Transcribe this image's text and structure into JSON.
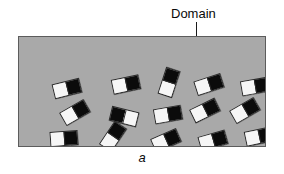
{
  "figure": {
    "caption": "a",
    "annotation_label": "Domain",
    "background_color": "#ffffff",
    "box": {
      "fill_color": "#a9a9a9",
      "border_color": "#5c5c5c",
      "x": 18,
      "y": 36,
      "width": 248,
      "height": 111
    },
    "leader_line": {
      "color": "#1a1a1a",
      "x": 196,
      "y_start": 22,
      "y_end": 51
    },
    "domain_style": {
      "light_color": "#f6f6f6",
      "dark_color": "#0b0b0b",
      "outline_color": "#2b2b2b",
      "width": 28,
      "height": 15
    },
    "domain_count": 20,
    "domains": [
      {
        "id": "domain-1",
        "x": 34,
        "y": 44,
        "rotation": -14,
        "light_side": "left"
      },
      {
        "id": "domain-2",
        "x": 93,
        "y": 40,
        "rotation": -12,
        "light_side": "left"
      },
      {
        "id": "domain-3",
        "x": 136,
        "y": 38,
        "rotation": -72,
        "light_side": "left"
      },
      {
        "id": "domain-4",
        "x": 176,
        "y": 40,
        "rotation": -18,
        "light_side": "left"
      },
      {
        "id": "domain-5",
        "x": 222,
        "y": 42,
        "rotation": -10,
        "light_side": "left"
      },
      {
        "id": "domain-6",
        "x": 42,
        "y": 68,
        "rotation": -30,
        "light_side": "left"
      },
      {
        "id": "domain-7",
        "x": 91,
        "y": 72,
        "rotation": 14,
        "light_side": "right"
      },
      {
        "id": "domain-8",
        "x": 135,
        "y": 70,
        "rotation": -10,
        "light_side": "left"
      },
      {
        "id": "domain-9",
        "x": 172,
        "y": 66,
        "rotation": -26,
        "light_side": "left"
      },
      {
        "id": "domain-10",
        "x": 212,
        "y": 66,
        "rotation": -30,
        "light_side": "left"
      },
      {
        "id": "domain-11",
        "x": 31,
        "y": 94,
        "rotation": -4,
        "light_side": "left"
      },
      {
        "id": "domain-12",
        "x": 80,
        "y": 92,
        "rotation": -56,
        "light_side": "left"
      },
      {
        "id": "domain-13",
        "x": 133,
        "y": 96,
        "rotation": -24,
        "light_side": "left"
      },
      {
        "id": "domain-14",
        "x": 180,
        "y": 96,
        "rotation": -16,
        "light_side": "left"
      },
      {
        "id": "domain-15",
        "x": 226,
        "y": 92,
        "rotation": -12,
        "light_side": "left"
      },
      {
        "id": "domain-16",
        "x": 34,
        "y": 120,
        "rotation": -10,
        "light_side": "left"
      },
      {
        "id": "domain-17",
        "x": 83,
        "y": 122,
        "rotation": -6,
        "light_side": "left"
      },
      {
        "id": "domain-18",
        "x": 128,
        "y": 118,
        "rotation": -32,
        "light_side": "left"
      },
      {
        "id": "domain-19",
        "x": 176,
        "y": 118,
        "rotation": -20,
        "light_side": "left"
      },
      {
        "id": "domain-20",
        "x": 222,
        "y": 120,
        "rotation": -16,
        "light_side": "left"
      }
    ]
  }
}
